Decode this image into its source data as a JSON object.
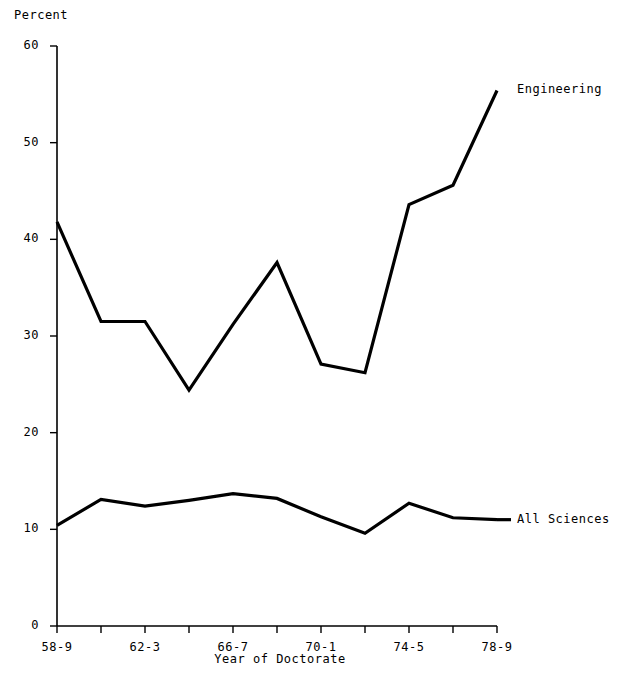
{
  "chart_data": {
    "type": "line",
    "title": "",
    "xlabel": "Year of Doctorate",
    "ylabel": "Percent",
    "ylim": [
      0,
      60
    ],
    "yticks": [
      0,
      10,
      20,
      30,
      40,
      50,
      60
    ],
    "ytick_labels": [
      "0",
      "10",
      "20",
      "30",
      "40",
      "50",
      "60"
    ],
    "grid": false,
    "legend_position": "right-inline",
    "categories": [
      "58-9",
      "60-1",
      "62-3",
      "64-5",
      "66-7",
      "68-9",
      "70-1",
      "72-3",
      "74-5",
      "76-7",
      "78-9"
    ],
    "xtick_labels_visible": [
      "58-9",
      "",
      "62-3",
      "",
      "66-7",
      "",
      "70-1",
      "",
      "74-5",
      "",
      "78-9"
    ],
    "series": [
      {
        "name": "Engineering",
        "values": [
          41.8,
          31.5,
          31.5,
          24.4,
          31.2,
          37.6,
          27.1,
          26.2,
          43.6,
          45.6,
          55.4
        ],
        "color": "#000000"
      },
      {
        "name": "All Sciences",
        "values": [
          10.4,
          13.1,
          12.4,
          13.0,
          13.7,
          13.2,
          11.3,
          9.6,
          12.7,
          11.2,
          11.0
        ],
        "color": "#000000"
      }
    ]
  },
  "axis": {
    "y_axis_title": "Percent",
    "x_axis_title": "Year of Doctorate"
  },
  "labels": {
    "engineering": "Engineering",
    "all_sciences": "All Sciences"
  },
  "colors": {
    "line": "#000000",
    "axis": "#000000",
    "background": "#ffffff"
  }
}
